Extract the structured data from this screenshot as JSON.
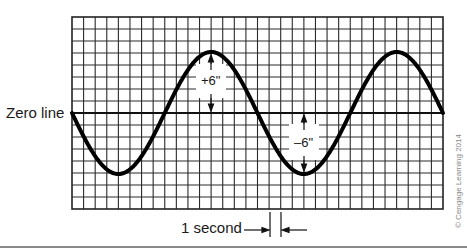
{
  "diagram": {
    "zero_line_label": "Zero line",
    "positive_amplitude_label": "+6\"",
    "negative_amplitude_label": "–6\"",
    "time_scale_label": "1 second",
    "copyright": "© Cengage Learning 2014",
    "grid": {
      "columns": 32,
      "rows": 16,
      "zero_row": 8
    },
    "wave": {
      "amplitude_rows": 5,
      "period_columns": 16,
      "cycles_shown": 2.0,
      "start_direction": "down"
    },
    "colors": {
      "grid": "#222222",
      "wave": "#000000",
      "background": "#ffffff"
    }
  }
}
